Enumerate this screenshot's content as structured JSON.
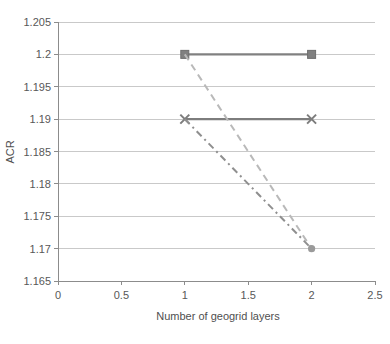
{
  "chart_data": {
    "type": "line",
    "title": "",
    "xlabel": "Number of geogrid layers",
    "ylabel": "ACR",
    "xlim": [
      0,
      2.5
    ],
    "ylim": [
      1.165,
      1.205
    ],
    "xticks": [
      0,
      0.5,
      1,
      1.5,
      2,
      2.5
    ],
    "xtick_labels": [
      "0",
      "0.5",
      "1",
      "1.5",
      "2",
      "2.5"
    ],
    "yticks": [
      1.165,
      1.17,
      1.175,
      1.18,
      1.185,
      1.19,
      1.195,
      1.2,
      1.205
    ],
    "ytick_labels": [
      "1.165",
      "1.17",
      "1.175",
      "1.18",
      "1.185",
      "1.19",
      "1.195",
      "1.2",
      "1.205"
    ],
    "grid": true,
    "grid_axis": "y",
    "legend": "none",
    "x": [
      1,
      2
    ],
    "series": [
      {
        "name": "series-1-solid-square",
        "values": [
          1.2,
          1.2
        ],
        "style": "solid",
        "marker": "square",
        "color": "#808080"
      },
      {
        "name": "series-2-solid-cross",
        "values": [
          1.19,
          1.19
        ],
        "style": "solid",
        "marker": "x",
        "color": "#7d7d7d"
      },
      {
        "name": "series-3-dashed",
        "values": [
          1.2,
          1.17
        ],
        "style": "dashed",
        "marker": "none",
        "color": "#b9b9b9"
      },
      {
        "name": "series-4-dashdot",
        "values": [
          1.19,
          1.17
        ],
        "style": "dashdot",
        "marker": "circle",
        "color": "#8f8f8f"
      }
    ]
  },
  "colors": {
    "axis": "#8c8c8c",
    "grid": "#c9c9c9",
    "text": "#585858",
    "background": "#ffffff"
  }
}
